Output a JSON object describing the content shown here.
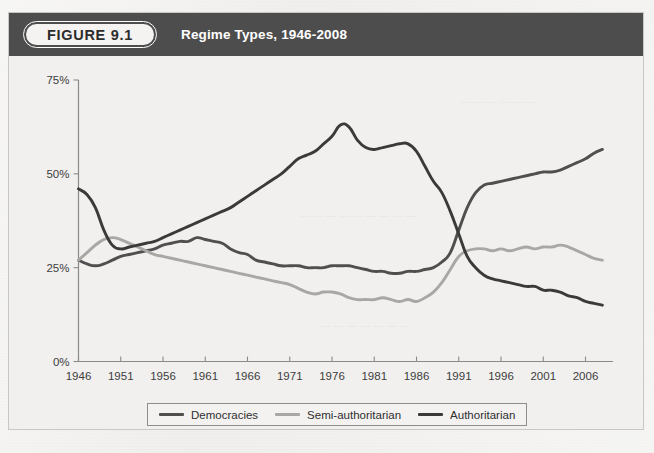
{
  "figure": {
    "badge_label": "FIGURE 9.1",
    "title": "Regime Types, 1946-2008",
    "header_bg": "#4d4d4d",
    "page_bg": "#eeedeb"
  },
  "legend": {
    "position": "bottom-center",
    "items": [
      {
        "label": "Democracies",
        "color": "#4f4f4f",
        "icon": "line-swatch"
      },
      {
        "label": "Semi-authoritarian",
        "color": "#a8a7a3",
        "icon": "line-swatch"
      },
      {
        "label": "Authoritarian",
        "color": "#3a3a3a",
        "icon": "line-swatch"
      }
    ]
  },
  "axes": {
    "y_ticks": [
      "0%",
      "25%",
      "50%",
      "75%"
    ],
    "x_ticks": [
      "1946",
      "1951",
      "1956",
      "1961",
      "1966",
      "1971",
      "1976",
      "1981",
      "1986",
      "1991",
      "1996",
      "2001",
      "2006"
    ]
  },
  "chart_data": {
    "type": "line",
    "title": "Regime Types, 1946-2008",
    "xlabel": "",
    "ylabel": "",
    "xlim": [
      1946,
      2008
    ],
    "ylim": [
      0,
      75
    ],
    "y_unit": "percent",
    "grid": false,
    "legend_position": "bottom-center",
    "x": [
      1946,
      1947,
      1948,
      1949,
      1950,
      1951,
      1952,
      1953,
      1954,
      1955,
      1956,
      1957,
      1958,
      1959,
      1960,
      1961,
      1962,
      1963,
      1964,
      1965,
      1966,
      1967,
      1968,
      1969,
      1970,
      1971,
      1972,
      1973,
      1974,
      1975,
      1976,
      1977,
      1978,
      1979,
      1980,
      1981,
      1982,
      1983,
      1984,
      1985,
      1986,
      1987,
      1988,
      1989,
      1990,
      1991,
      1992,
      1993,
      1994,
      1995,
      1996,
      1997,
      1998,
      1999,
      2000,
      2001,
      2002,
      2003,
      2004,
      2005,
      2006,
      2007,
      2008
    ],
    "series": [
      {
        "name": "Democracies",
        "color": "#4f4f4f",
        "values": [
          27,
          26,
          25.5,
          26,
          27,
          28,
          28.5,
          29,
          29.5,
          30,
          31,
          31.5,
          32,
          32,
          33,
          32.5,
          32,
          31.5,
          30,
          29,
          28.5,
          27,
          26.5,
          26,
          25.5,
          25.5,
          25.5,
          25,
          25,
          25,
          25.5,
          25.5,
          25.5,
          25,
          24.5,
          24,
          24,
          23.5,
          23.5,
          24,
          24,
          24.5,
          25,
          26.5,
          29,
          35,
          41,
          45,
          47,
          47.5,
          48,
          48.5,
          49,
          49.5,
          50,
          50.5,
          50.5,
          51,
          52,
          53,
          54,
          55.5,
          56.5
        ]
      },
      {
        "name": "Semi-authoritarian",
        "color": "#a8a7a3",
        "values": [
          27,
          29,
          31,
          32.5,
          33,
          32.5,
          31.5,
          30.5,
          29.5,
          28.5,
          28,
          27.5,
          27,
          26.5,
          26,
          25.5,
          25,
          24.5,
          24,
          23.5,
          23,
          22.5,
          22,
          21.5,
          21,
          20.5,
          19.5,
          18.5,
          18,
          18.5,
          18.5,
          18,
          17,
          16.5,
          16.5,
          16.5,
          17,
          16.5,
          16,
          16.5,
          16,
          17,
          18.5,
          21,
          24.5,
          28,
          29.5,
          30,
          30,
          29.5,
          30,
          29.5,
          30,
          30.5,
          30,
          30.5,
          30.5,
          31,
          30.5,
          29.5,
          28.5,
          27.5,
          27
        ]
      },
      {
        "name": "Authoritarian",
        "color": "#3a3a3a",
        "values": [
          46,
          44.5,
          41,
          35,
          31,
          30,
          30.5,
          31,
          31.5,
          32,
          33,
          34,
          35,
          36,
          37,
          38,
          39,
          40,
          41,
          42.5,
          44,
          45.5,
          47,
          48.5,
          50,
          52,
          54,
          55,
          56,
          58,
          60,
          63,
          62.5,
          59,
          57,
          56.5,
          57,
          57.5,
          58,
          58,
          56,
          52,
          48,
          45,
          40,
          34,
          28,
          25,
          23,
          22,
          21.5,
          21,
          20.5,
          20,
          20,
          19,
          19,
          18.5,
          17.5,
          17,
          16,
          15.5,
          15
        ]
      }
    ]
  }
}
